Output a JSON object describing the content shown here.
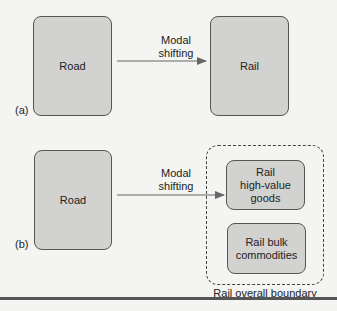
{
  "panel_a": {
    "label": "(a)",
    "source": "Road",
    "target": "Rail",
    "arrow_label_line1": "Modal",
    "arrow_label_line2": "shifting"
  },
  "panel_b": {
    "label": "(b)",
    "source": "Road",
    "arrow_label_line1": "Modal",
    "arrow_label_line2": "shifting",
    "target_high_line1": "Rail",
    "target_high_line2": "high-value",
    "target_high_line3": "goods",
    "target_bulk_line1": "Rail bulk",
    "target_bulk_line2": "commodities",
    "boundary_label": "Rail overall boundary"
  },
  "colors": {
    "box_fill": "#d2d2d0",
    "stroke": "#555555",
    "background": "#f4f4f2"
  }
}
